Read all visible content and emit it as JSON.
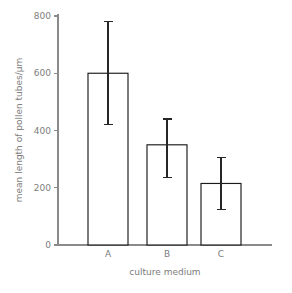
{
  "chart_data": {
    "type": "bar",
    "title": "",
    "subtitle": "",
    "xlabel": "culture medium",
    "ylabel": "mean length of pollen tubes/µm",
    "categories": [
      "A",
      "B",
      "C"
    ],
    "values": [
      600,
      350,
      215
    ],
    "errors_upper": [
      780,
      440,
      305
    ],
    "errors_lower": [
      420,
      235,
      125
    ],
    "yticks": [
      0,
      200,
      400,
      600,
      800
    ],
    "ytick_labels": [
      "0",
      "200",
      "400",
      "600",
      "800"
    ],
    "ylim": [
      0,
      800
    ],
    "grid": false,
    "legend": "none",
    "series": [
      {
        "name": "mean length of pollen tubes",
        "values": [
          600,
          350,
          215
        ],
        "error_high": [
          780,
          440,
          305
        ],
        "error_low": [
          420,
          235,
          125
        ]
      }
    ],
    "colors": {
      "bar_fill": "#ffffff",
      "bar_stroke": "#1b1b1b",
      "error_stroke": "#262626",
      "axis": "#8a8a8a",
      "text": "#7d7d7d",
      "background": "#ffffff"
    },
    "geometry": {
      "x_origin_px": 58,
      "y_zero_px": 245,
      "y_top_px": 16,
      "x_axis_end_px": 272,
      "y_axis_top_px": 14,
      "bar_width_px": 40,
      "bar_centers_px": [
        108,
        167,
        221
      ],
      "cap_half_width_px": 4.5
    }
  }
}
